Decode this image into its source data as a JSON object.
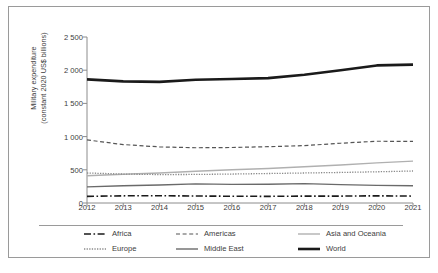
{
  "chart_data": {
    "type": "line",
    "title": "",
    "xlabel": "",
    "ylabel": "Military expenditure (constant 2020 US$ billions)",
    "ylabel_line1": "Military expenditure",
    "ylabel_line2": "(constant 2020 US$ billions)",
    "x": [
      2012,
      2013,
      2014,
      2015,
      2016,
      2017,
      2018,
      2019,
      2020,
      2021
    ],
    "categories": [
      "2012",
      "2013",
      "2014",
      "2015",
      "2016",
      "2017",
      "2018",
      "2019",
      "2020",
      "2021"
    ],
    "xlim": [
      2012,
      2021
    ],
    "ylim": [
      0,
      2500
    ],
    "yticks": [
      0,
      500,
      1000,
      1500,
      2000,
      2500
    ],
    "ytick_labels": [
      "0",
      "500",
      "1 000",
      "1 500",
      "2 000",
      "2 500"
    ],
    "grid": false,
    "legend_position": "bottom",
    "series": [
      {
        "name": "Africa",
        "style": "dash-dot",
        "color": "#1a1a1a",
        "width": 1.6,
        "dasharray": "7,2.5,1.6,2.5",
        "values": [
          100,
          108,
          110,
          105,
          102,
          100,
          104,
          104,
          108,
          104
        ]
      },
      {
        "name": "Americas",
        "style": "dashed",
        "color": "#555555",
        "width": 1.2,
        "dasharray": "4,2.6",
        "values": [
          950,
          880,
          845,
          832,
          836,
          848,
          864,
          900,
          930,
          928
        ]
      },
      {
        "name": "Asia and Oceania",
        "style": "solid",
        "color": "#b0b0b0",
        "width": 1.4,
        "dasharray": "",
        "values": [
          410,
          432,
          452,
          478,
          500,
          520,
          546,
          572,
          604,
          630
        ]
      },
      {
        "name": "Europe",
        "style": "dotted",
        "color": "#8a8a8a",
        "width": 1.3,
        "dasharray": "1.3,1.3",
        "values": [
          452,
          436,
          428,
          430,
          436,
          444,
          452,
          460,
          470,
          482
        ]
      },
      {
        "name": "Middle East",
        "style": "solid",
        "color": "#6a6a6a",
        "width": 1.4,
        "dasharray": "",
        "values": [
          243,
          260,
          272,
          288,
          280,
          282,
          292,
          276,
          266,
          260
        ]
      },
      {
        "name": "World",
        "style": "solid",
        "color": "#1a1a1a",
        "width": 2.6,
        "dasharray": "",
        "values": [
          1862,
          1832,
          1824,
          1856,
          1868,
          1880,
          1932,
          2000,
          2072,
          2084
        ]
      }
    ]
  },
  "legend": {
    "rows": [
      [
        {
          "label": "Africa",
          "series": "Africa"
        },
        {
          "label": "Americas",
          "series": "Americas"
        },
        {
          "label": "Asia and Oceania",
          "series": "Asia and Oceania"
        }
      ],
      [
        {
          "label": "Europe",
          "series": "Europe"
        },
        {
          "label": "Middle East",
          "series": "Middle East"
        },
        {
          "label": "World",
          "series": "World"
        }
      ]
    ]
  }
}
